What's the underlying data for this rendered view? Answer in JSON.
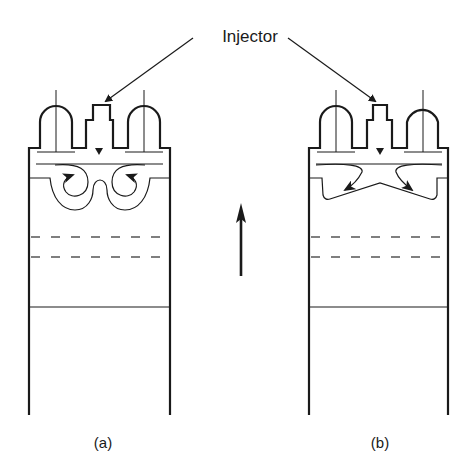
{
  "diagram": {
    "callout_label": "Injector",
    "panels": [
      {
        "id": "a",
        "label": "(a)",
        "description": "Deep re-entrant bowl piston with toroidal swirl"
      },
      {
        "id": "b",
        "label": "(b)",
        "description": "Shallow open bowl piston with outward flow"
      }
    ],
    "motion_indicator": "upward-arrow",
    "colors": {
      "stroke": "#1a1a1a",
      "dash": "#555555",
      "background": "#ffffff"
    }
  }
}
